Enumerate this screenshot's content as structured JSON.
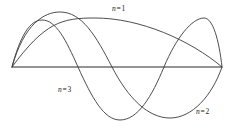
{
  "figure": {
    "background_color": "#ffffff",
    "curve_color": "#3a3a3a",
    "axis_color": "#2b2b2b",
    "label_color": "#1a1a1a"
  },
  "labels": {
    "n1": {
      "variable": "n",
      "equals": "=",
      "value": "1",
      "text": "n = 1"
    },
    "n2": {
      "variable": "n",
      "equals": "=",
      "value": "2",
      "text": "n = 2"
    },
    "n3": {
      "variable": "n",
      "equals": "=",
      "value": "3",
      "text": "n = 3"
    }
  },
  "chart_data": {
    "type": "line",
    "title": "",
    "subtitle": "",
    "xlabel": "",
    "ylabel": "",
    "xlim": [
      0,
      1
    ],
    "ylim": [
      -1,
      1
    ],
    "grid": false,
    "legend": "inline-annotations",
    "axis": {
      "name": "string-at-rest",
      "x_start_px": 12,
      "x_end_px": 222,
      "y_px": 67,
      "description": "horizontal equilibrium line of the string, nodes fixed at both ends"
    },
    "annotations": [
      {
        "text": "n = 1",
        "x_px": 112,
        "y_px": 5
      },
      {
        "text": "n = 3",
        "x_px": 58,
        "y_px": 86
      },
      {
        "text": "n = 2",
        "x_px": 196,
        "y_px": 108
      }
    ],
    "series": [
      {
        "name": "n = 1",
        "harmonic": 1,
        "nodes": 2,
        "antinodes": 1,
        "half_wavelengths": 1,
        "amplitude_px": 49,
        "formula": "y = A sin(1 * pi * x / L)",
        "path": "M 12 67 C 45 22, 62 18, 95 18 C 140 18, 190 40, 222 67",
        "x": [
          0,
          0.125,
          0.25,
          0.375,
          0.5,
          0.625,
          0.75,
          0.875,
          1
        ],
        "values": [
          0,
          0.38,
          0.71,
          0.92,
          1,
          0.92,
          0.71,
          0.38,
          0
        ]
      },
      {
        "name": "n = 2",
        "harmonic": 2,
        "nodes": 3,
        "antinodes": 2,
        "half_wavelengths": 2,
        "amplitude_px": 53,
        "formula": "y = A sin(2 * pi * x / L)",
        "path": "M 12 67 C 24 24, 44 12, 60 12 C 82 12, 96 36, 112 67 C 128 98, 148 118, 170 118 C 192 118, 212 96, 222 67",
        "x": [
          0,
          0.125,
          0.25,
          0.375,
          0.5,
          0.625,
          0.75,
          0.875,
          1
        ],
        "values": [
          0,
          0.71,
          1,
          0.71,
          0,
          -0.71,
          -1,
          -0.71,
          0
        ]
      },
      {
        "name": "n = 3",
        "harmonic": 3,
        "nodes": 4,
        "antinodes": 3,
        "half_wavelengths": 3,
        "amplitude_px": 53,
        "formula": "y = A sin(3 * pi * x / L)",
        "path": "M 12 67 C 20 36, 30 20, 42 20 C 56 20, 66 40, 78 67 C 92 98, 104 120, 120 120 C 138 120, 152 96, 164 67 C 176 38, 192 18, 204 18 C 213 18, 219 40, 222 67",
        "x": [
          0,
          0.0833,
          0.1667,
          0.25,
          0.3333,
          0.4167,
          0.5,
          0.5833,
          0.6667,
          0.75,
          0.8333,
          0.9167,
          1
        ],
        "values": [
          0,
          0.71,
          1,
          0.71,
          0,
          -0.71,
          -1,
          -0.71,
          0,
          0.71,
          1,
          0.71,
          0
        ]
      }
    ]
  }
}
